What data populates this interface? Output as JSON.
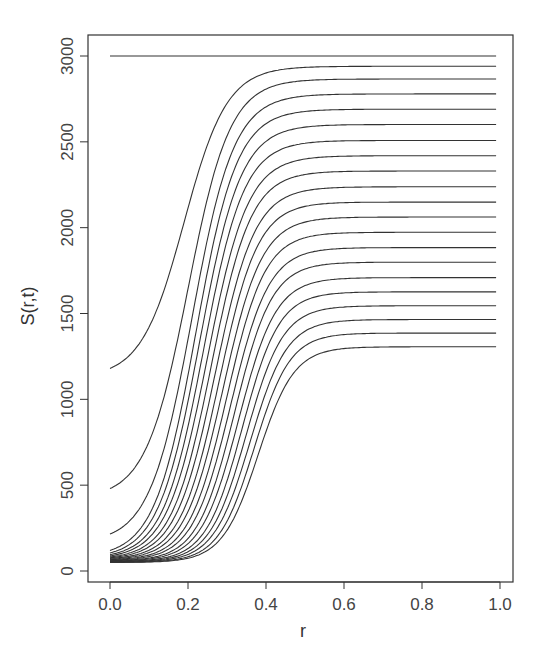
{
  "chart_data": {
    "type": "line",
    "title": "",
    "xlabel": "r",
    "ylabel": "S(r,t)",
    "xlim": [
      0.0,
      1.0
    ],
    "ylim": [
      0,
      3000
    ],
    "x_ticks": [
      "0.0",
      "0.2",
      "0.4",
      "0.6",
      "0.8",
      "1.0"
    ],
    "x_tick_values": [
      0.0,
      0.2,
      0.4,
      0.6,
      0.8,
      1.0
    ],
    "y_ticks": [
      "0",
      "500",
      "1000",
      "1500",
      "2000",
      "2500",
      "3000"
    ],
    "y_tick_values": [
      0,
      500,
      1000,
      1500,
      2000,
      2500,
      3000
    ],
    "grid": false,
    "legend": null,
    "line_color": "#333333",
    "x": [
      0.0,
      0.1,
      0.2,
      0.3,
      0.4,
      0.5,
      0.6,
      0.8,
      1.0
    ],
    "series": [
      {
        "name": "t0",
        "values": [
          3000,
          3000,
          3000,
          3000,
          3000,
          3000,
          3000,
          3000,
          3000
        ]
      },
      {
        "name": "t1",
        "start": 1180,
        "plateau": 2940,
        "mid": 0.19,
        "scale": 0.055,
        "values": [
          1180,
          1420,
          2080,
          2700,
          2900,
          2935,
          2940,
          2940,
          2940
        ]
      },
      {
        "name": "t2",
        "start": 480,
        "plateau": 2866,
        "mid": 0.2,
        "scale": 0.054,
        "values": [
          480,
          820,
          1680,
          2540,
          2810,
          2860,
          2866,
          2866,
          2866
        ]
      },
      {
        "name": "t3",
        "start": 215,
        "plateau": 2779,
        "mid": 0.21,
        "scale": 0.054,
        "values": [
          215,
          480,
          1320,
          2350,
          2700,
          2770,
          2779,
          2779,
          2779
        ]
      },
      {
        "name": "t4",
        "start": 120,
        "plateau": 2690,
        "mid": 0.22,
        "scale": 0.053,
        "values": [
          120,
          330,
          1080,
          2160,
          2590,
          2675,
          2688,
          2690,
          2690
        ]
      },
      {
        "name": "t5",
        "start": 105,
        "plateau": 2601,
        "mid": 0.23,
        "scale": 0.053,
        "values": [
          105,
          250,
          880,
          1960,
          2480,
          2585,
          2598,
          2601,
          2601
        ]
      },
      {
        "name": "t6",
        "start": 95,
        "plateau": 2508,
        "mid": 0.24,
        "scale": 0.052,
        "values": [
          95,
          200,
          720,
          1760,
          2360,
          2490,
          2505,
          2508,
          2508
        ]
      },
      {
        "name": "t7",
        "start": 88,
        "plateau": 2419,
        "mid": 0.25,
        "scale": 0.052,
        "values": [
          88,
          170,
          600,
          1580,
          2240,
          2395,
          2415,
          2419,
          2419
        ]
      },
      {
        "name": "t8",
        "start": 82,
        "plateau": 2330,
        "mid": 0.26,
        "scale": 0.051,
        "values": [
          82,
          150,
          500,
          1400,
          2110,
          2300,
          2325,
          2330,
          2330
        ]
      },
      {
        "name": "t9",
        "start": 77,
        "plateau": 2238,
        "mid": 0.27,
        "scale": 0.051,
        "values": [
          77,
          135,
          420,
          1240,
          1980,
          2205,
          2233,
          2238,
          2238
        ]
      },
      {
        "name": "t10",
        "start": 73,
        "plateau": 2149,
        "mid": 0.28,
        "scale": 0.05,
        "values": [
          73,
          122,
          355,
          1100,
          1850,
          2110,
          2143,
          2149,
          2149
        ]
      },
      {
        "name": "t11",
        "start": 69,
        "plateau": 2062,
        "mid": 0.29,
        "scale": 0.05,
        "values": [
          69,
          112,
          305,
          960,
          1720,
          2015,
          2055,
          2062,
          2062
        ]
      },
      {
        "name": "t12",
        "start": 66,
        "plateau": 1973,
        "mid": 0.3,
        "scale": 0.049,
        "values": [
          66,
          104,
          260,
          840,
          1590,
          1920,
          1965,
          1973,
          1973
        ]
      },
      {
        "name": "t13",
        "start": 63,
        "plateau": 1884,
        "mid": 0.31,
        "scale": 0.049,
        "values": [
          63,
          97,
          225,
          730,
          1460,
          1825,
          1875,
          1884,
          1884
        ]
      },
      {
        "name": "t14",
        "start": 60,
        "plateau": 1799,
        "mid": 0.32,
        "scale": 0.048,
        "values": [
          60,
          91,
          195,
          635,
          1340,
          1730,
          1789,
          1799,
          1799
        ]
      },
      {
        "name": "t15",
        "start": 58,
        "plateau": 1709,
        "mid": 0.33,
        "scale": 0.048,
        "values": [
          58,
          86,
          172,
          550,
          1220,
          1630,
          1697,
          1709,
          1709
        ]
      },
      {
        "name": "t16",
        "start": 56,
        "plateau": 1626,
        "mid": 0.34,
        "scale": 0.047,
        "values": [
          56,
          82,
          153,
          475,
          1110,
          1535,
          1612,
          1626,
          1626
        ]
      },
      {
        "name": "t17",
        "start": 54,
        "plateau": 1545,
        "mid": 0.35,
        "scale": 0.047,
        "values": [
          54,
          78,
          137,
          410,
          1000,
          1445,
          1528,
          1545,
          1545
        ]
      },
      {
        "name": "t18",
        "start": 52,
        "plateau": 1465,
        "mid": 0.36,
        "scale": 0.047,
        "values": [
          52,
          75,
          124,
          355,
          900,
          1355,
          1445,
          1465,
          1465
        ]
      },
      {
        "name": "t19",
        "start": 51,
        "plateau": 1386,
        "mid": 0.37,
        "scale": 0.046,
        "values": [
          51,
          72,
          113,
          310,
          810,
          1270,
          1363,
          1386,
          1386
        ]
      },
      {
        "name": "t20",
        "start": 50,
        "plateau": 1306,
        "mid": 0.38,
        "scale": 0.046,
        "values": [
          50,
          70,
          104,
          270,
          720,
          1180,
          1280,
          1306,
          1306
        ]
      }
    ]
  }
}
